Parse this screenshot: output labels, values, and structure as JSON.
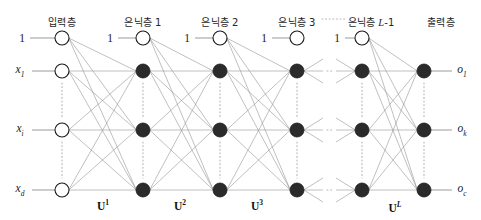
{
  "figure": {
    "type": "neural-network-diagram"
  },
  "layer_titles": [
    {
      "text": "입력층",
      "x": 62
    },
    {
      "text": "은닉층 1",
      "x": 143
    },
    {
      "text": "은닉층 2",
      "x": 220
    },
    {
      "text": "은닉층 3",
      "x": 297
    },
    {
      "text": "은닉층 L-1",
      "x": 370,
      "ital": "L"
    },
    {
      "text": "출력층",
      "x": 440
    }
  ],
  "titles": {
    "input": "입력층",
    "hidden1": "은닉층 1",
    "hidden2": "은닉층 2",
    "hidden3": "은닉층 3",
    "hiddenL1_prefix": "은닉층 ",
    "hiddenL1_ital": "L",
    "hiddenL1_suffix": "-1",
    "output": "출력층"
  },
  "input_labels": [
    {
      "base": "x",
      "sub": "1",
      "y": 71
    },
    {
      "base": "x",
      "sub": "i",
      "y": 130
    },
    {
      "base": "x",
      "sub": "d",
      "y": 190
    }
  ],
  "output_labels": [
    {
      "base": "o",
      "sub": "1",
      "y": 71
    },
    {
      "base": "o",
      "sub": "k",
      "y": 130
    },
    {
      "base": "o",
      "sub": "c",
      "y": 190
    }
  ],
  "bias_labels": [
    {
      "text": "1",
      "x": 22,
      "y": 38
    },
    {
      "text": "1",
      "x": 110,
      "y": 38
    },
    {
      "text": "1",
      "x": 187,
      "y": 38
    },
    {
      "text": "1",
      "x": 264,
      "y": 38
    },
    {
      "text": "1",
      "x": 337,
      "y": 38
    }
  ],
  "weight_labels": [
    {
      "base": "U",
      "sup": "1",
      "ital": false,
      "x": 103,
      "y": 205
    },
    {
      "base": "U",
      "sup": "2",
      "ital": false,
      "x": 180,
      "y": 205
    },
    {
      "base": "U",
      "sup": "3",
      "ital": false,
      "x": 257,
      "y": 205
    },
    {
      "base": "U",
      "sup": "L",
      "ital": true,
      "x": 395,
      "y": 207
    }
  ],
  "geometry": {
    "node_radius": 7,
    "bias_y": 38,
    "node_rows": [
      71,
      130,
      190
    ],
    "columns": {
      "input": 62,
      "hidden1": 143,
      "hidden2": 220,
      "hidden3": 297,
      "hiddenL1": 362,
      "output": 424
    }
  },
  "colors": {
    "filled_node": "#2b2b2b",
    "hollow_node_fill": "#ffffff",
    "node_stroke": "#1a1a1a",
    "edge": "#8c8c8c",
    "axis_line": "#8c8c8c",
    "dotted": "#b5b5b5",
    "text": "#1a1a1a",
    "background": "#ffffff"
  },
  "ellipsis": {
    "horizontal_rows": [
      71,
      130,
      190
    ],
    "header_dots_x": 330
  }
}
